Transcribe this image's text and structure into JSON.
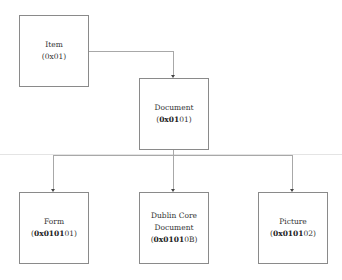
{
  "diagram": {
    "type": "hierarchy",
    "nodes": [
      {
        "id": "item",
        "label": "Item",
        "code_bold": "",
        "code_rest": "0x01"
      },
      {
        "id": "document",
        "label": "Document",
        "code_bold": "0x01",
        "code_rest": "01"
      },
      {
        "id": "form",
        "label": "Form",
        "code_bold": "0x0101",
        "code_rest": "01"
      },
      {
        "id": "dublin-core",
        "label": "Dublin Core Document",
        "label_line1": "Dublin Core",
        "label_line2": "Document",
        "code_bold": "0x0101",
        "code_rest": "0B"
      },
      {
        "id": "picture",
        "label": "Picture",
        "code_bold": "0x0101",
        "code_rest": "02"
      }
    ],
    "edges": [
      {
        "from": "item",
        "to": "document"
      },
      {
        "from": "document",
        "to": "form"
      },
      {
        "from": "document",
        "to": "dublin-core"
      },
      {
        "from": "document",
        "to": "picture"
      }
    ],
    "colors": {
      "border": "#8a8a8a",
      "connector": "#a8a8a8",
      "text": "#333333"
    }
  }
}
